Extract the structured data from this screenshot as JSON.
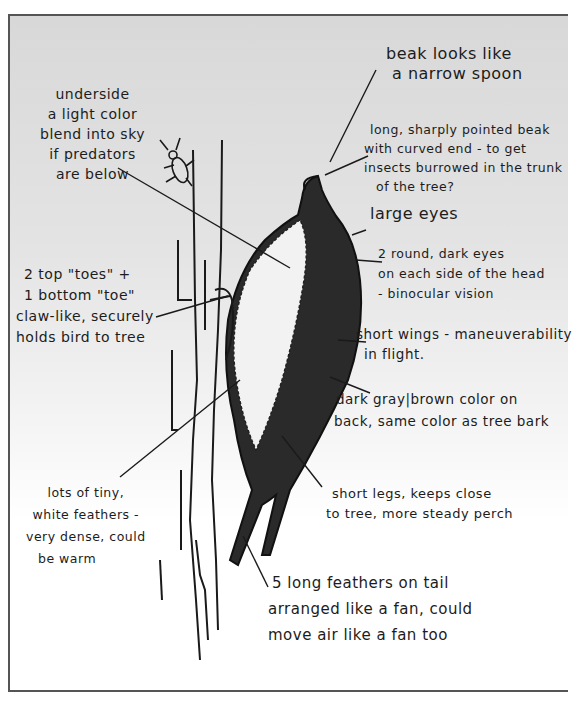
{
  "figure": {
    "background": "#ffffff",
    "frame_color": "#555555",
    "ink_color": "#1a1a1a"
  },
  "annotations": {
    "underside": {
      "lines": [
        "underside",
        "a light color",
        "blend into sky",
        "if predators",
        "are below"
      ]
    },
    "beak_heading": {
      "lines": [
        "beak looks like",
        "a narrow spoon"
      ]
    },
    "beak_detail": {
      "lines": [
        "long, sharply pointed beak",
        "with curved end - to get",
        "insects burrowed in the trunk",
        "of the tree?"
      ]
    },
    "eyes_heading": {
      "lines": [
        "large eyes"
      ]
    },
    "eyes_detail": {
      "lines": [
        "2 round, dark eyes",
        "on each side of the head",
        "- binocular vision"
      ]
    },
    "toes": {
      "lines": [
        "2 top \"toes\" +",
        "1 bottom \"toe\"",
        "claw-like, securely",
        "holds bird to tree"
      ]
    },
    "wings": {
      "lines": [
        "short wings - maneuverability",
        "in flight."
      ]
    },
    "back_color": {
      "lines": [
        "dark gray|brown color on",
        "back, same color as tree bark"
      ]
    },
    "feathers": {
      "lines": [
        "lots of tiny,",
        "white feathers -",
        "very dense, could",
        "be warm"
      ]
    },
    "legs": {
      "lines": [
        "short legs, keeps close",
        "to tree, more steady perch"
      ]
    },
    "tail": {
      "lines": [
        "5 long feathers on tail",
        "arranged like a fan, could",
        "move air like a fan too"
      ]
    }
  }
}
